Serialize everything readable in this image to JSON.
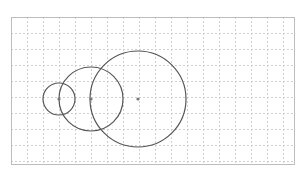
{
  "diagram": {
    "type": "circles-on-grid",
    "frame": {
      "x": 11,
      "y": 17,
      "width": 283,
      "height": 147,
      "stroke": "#bdbdbd"
    },
    "grid": {
      "spacing": 16,
      "color": "#d0d0d0",
      "dash": "2,2"
    },
    "circles": [
      {
        "cx": 59,
        "cy": 99,
        "r": 16,
        "stroke": "#555555"
      },
      {
        "cx": 91,
        "cy": 99,
        "r": 32,
        "stroke": "#555555"
      },
      {
        "cx": 138,
        "cy": 99,
        "r": 48,
        "stroke": "#555555"
      }
    ],
    "center_points": [
      {
        "x": 59,
        "y": 99
      },
      {
        "x": 91,
        "y": 99
      },
      {
        "x": 138,
        "y": 99
      }
    ],
    "point_color": "#777777"
  }
}
